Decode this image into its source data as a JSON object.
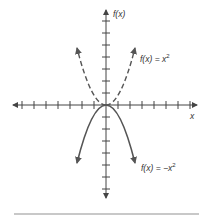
{
  "figure": {
    "origin_px": [
      106,
      105
    ],
    "tick_spacing_px": 12,
    "x_ticks_each_side": 7,
    "y_ticks_each_side": 7,
    "colors": {
      "axis": "#444444",
      "curve": "#555555",
      "divider": "#c8c8c8"
    }
  },
  "axes": {
    "x_label": "x",
    "y_label": "f(x)"
  },
  "curves": [
    {
      "name": "x-squared",
      "label": "f(x) = x",
      "exponent": "2",
      "style": "dashed",
      "sign": 1
    },
    {
      "name": "neg-x-squared",
      "label": "f(x) = −x",
      "exponent": "2",
      "style": "solid",
      "sign": -1
    }
  ]
}
